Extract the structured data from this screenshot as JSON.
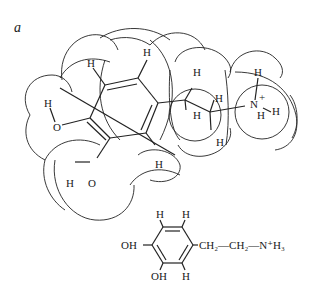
{
  "figure": {
    "panel_label": "a",
    "molecule": "protonated dopamine",
    "space_filling_model": {
      "atom_labels": [
        {
          "id": "h-ring-top-left",
          "text": "H"
        },
        {
          "id": "h-ring-top-right",
          "text": "H"
        },
        {
          "id": "h-hydroxyl-upper",
          "text": "H"
        },
        {
          "id": "o-hydroxyl-upper",
          "text": "O"
        },
        {
          "id": "h-hydroxyl-lower",
          "text": "H"
        },
        {
          "id": "o-hydroxyl-lower",
          "text": "O"
        },
        {
          "id": "h-ring-bottom",
          "text": "H"
        },
        {
          "id": "h-ch2-a-top",
          "text": "H"
        },
        {
          "id": "h-ch2-a-bottom",
          "text": "H"
        },
        {
          "id": "h-ch2-b-top",
          "text": "H"
        },
        {
          "id": "h-ch2-b-bottom",
          "text": "H"
        },
        {
          "id": "n-amine",
          "text": "N",
          "charge": "+"
        },
        {
          "id": "h-amine-top",
          "text": "H"
        },
        {
          "id": "h-amine-right",
          "text": "H"
        },
        {
          "id": "h-amine-bottom",
          "text": "H"
        }
      ]
    },
    "structural_formula": {
      "ring_h_top_left": "H",
      "ring_h_top_right": "H",
      "ring_h_bottom": "H",
      "oh_upper": "OH",
      "oh_lower": "OH",
      "side_chain": "CH₂—CH₂—N⁺H₃"
    }
  }
}
